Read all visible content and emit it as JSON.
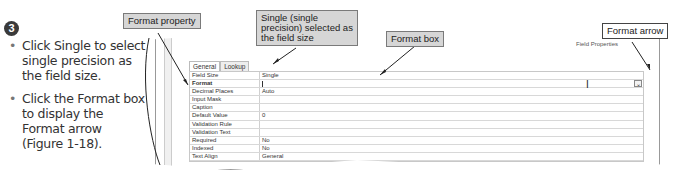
{
  "step": {
    "number": "3"
  },
  "instructions": [
    "Click Single to select single precision as the field size.",
    "Click the Format box to display the Format arrow (Figure 1-18)."
  ],
  "callouts": {
    "format_property": "Format property",
    "single_selected": "Single (single precision) selected as the field size",
    "format_box": "Format box",
    "format_arrow": "Format arrow"
  },
  "panel": {
    "title": "Field Properties",
    "tabs": [
      {
        "label": "General",
        "active": true
      },
      {
        "label": "Lookup",
        "active": false
      }
    ],
    "properties": [
      {
        "name": "Field Size",
        "value": "Single"
      },
      {
        "name": "Format",
        "value": ""
      },
      {
        "name": "Decimal Places",
        "value": "Auto"
      },
      {
        "name": "Input Mask",
        "value": ""
      },
      {
        "name": "Caption",
        "value": ""
      },
      {
        "name": "Default Value",
        "value": "0"
      },
      {
        "name": "Validation Rule",
        "value": ""
      },
      {
        "name": "Validation Text",
        "value": ""
      },
      {
        "name": "Required",
        "value": "No"
      },
      {
        "name": "Indexed",
        "value": "No"
      },
      {
        "name": "Text Align",
        "value": "General"
      }
    ],
    "dropdown_glyph": "⌄",
    "ibeam_glyph": "I"
  }
}
